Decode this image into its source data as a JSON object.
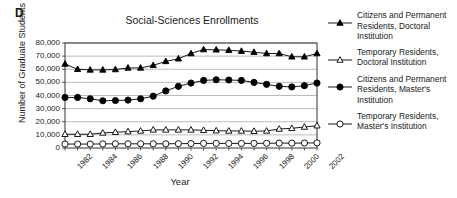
{
  "figure": {
    "panel_label": "D",
    "title": "Social-Sciences Enrollments",
    "xlabel": "Year",
    "ylabel": "Number of Graduate Students"
  },
  "legend": {
    "entries": [
      {
        "marker": "filled-triangle-marker",
        "label": "Citizens and Permanent Residents, Doctoral Institution"
      },
      {
        "marker": "open-triangle-marker",
        "label": "Temporary Residents, Doctoral Institution"
      },
      {
        "marker": "filled-circle-marker",
        "label": "Citizens and Permanent Residents, Master's Institution"
      },
      {
        "marker": "open-circle-marker",
        "label": "Temporary Residents, Master's Institution"
      }
    ]
  },
  "axes": {
    "y_ticks": [
      "0",
      "10,000",
      "20,000",
      "30,000",
      "40,000",
      "50,000",
      "60,000",
      "70,000",
      "80,000"
    ],
    "x_ticks": [
      "1982",
      "1984",
      "1986",
      "1988",
      "1990",
      "1992",
      "1994",
      "1996",
      "1998",
      "2000",
      "2002"
    ]
  },
  "chart_data": {
    "type": "line",
    "title": "Social-Sciences Enrollments",
    "xlabel": "Year",
    "ylabel": "Number of Graduate Students",
    "xlim": [
      1982,
      2002
    ],
    "ylim": [
      0,
      80000
    ],
    "ytick_values": [
      0,
      10000,
      20000,
      30000,
      40000,
      50000,
      60000,
      70000,
      80000
    ],
    "xtick_values": [
      1982,
      1984,
      1986,
      1988,
      1990,
      1992,
      1994,
      1996,
      1998,
      2000,
      2002
    ],
    "grid": "horizontal",
    "legend_position": "right",
    "x": [
      1982,
      1983,
      1984,
      1985,
      1986,
      1987,
      1988,
      1989,
      1990,
      1991,
      1992,
      1993,
      1994,
      1995,
      1996,
      1997,
      1998,
      1999,
      2000,
      2001,
      2002
    ],
    "series": [
      {
        "name": "Citizens and Permanent Residents, Doctoral Institution",
        "marker": "filled-triangle",
        "values": [
          64000,
          60000,
          59500,
          59500,
          59800,
          61000,
          61000,
          63000,
          66000,
          68000,
          72000,
          75000,
          74800,
          74500,
          73800,
          73000,
          72000,
          72000,
          69500,
          69500,
          72000
        ]
      },
      {
        "name": "Temporary Residents, Doctoral Institution",
        "marker": "open-triangle",
        "values": [
          10500,
          10500,
          10500,
          11500,
          12000,
          12500,
          13000,
          13800,
          13800,
          13800,
          13800,
          13500,
          13200,
          13000,
          13000,
          12800,
          13000,
          14500,
          15000,
          16000,
          17000
        ]
      },
      {
        "name": "Citizens and Permanent Residents, Master's Institution",
        "marker": "filled-circle",
        "values": [
          38500,
          38500,
          37500,
          36000,
          36200,
          36500,
          37500,
          39500,
          43500,
          47000,
          49500,
          51500,
          52000,
          51800,
          51500,
          50000,
          48500,
          47000,
          46500,
          47500,
          49500
        ]
      },
      {
        "name": "Temporary Residents, Master's Institution",
        "marker": "open-circle",
        "values": [
          3000,
          3000,
          3000,
          3100,
          3200,
          3200,
          3200,
          3200,
          3200,
          3300,
          3400,
          3500,
          3500,
          3500,
          3500,
          3500,
          3600,
          3700,
          3700,
          3800,
          3900
        ]
      }
    ]
  }
}
